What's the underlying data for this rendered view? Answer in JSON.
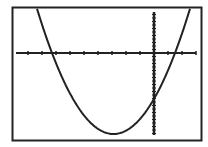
{
  "chart_data": {
    "type": "line",
    "title": "",
    "xlabel": "",
    "ylabel": "",
    "grid": false,
    "legend": "none",
    "x_ticks_count_left_of_origin": 10,
    "x_ticks_count_right_of_origin": 3,
    "series": [
      {
        "name": "parabola",
        "equation_shape": "y = a(x - r1)(x - r2), a > 0",
        "root_left_px": 52,
        "root_right_px": 175,
        "vertex_px": [
          113,
          134
        ],
        "y_intercept_px": 99
      }
    ]
  },
  "colors": {
    "foreground": "#222222",
    "background": "#ffffff"
  }
}
